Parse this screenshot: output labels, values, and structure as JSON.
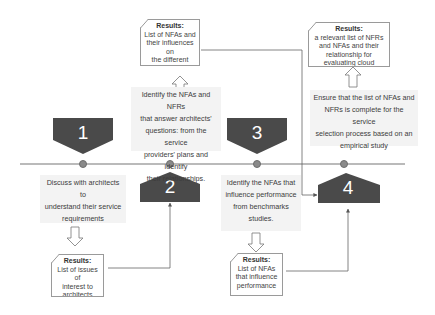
{
  "diagram": {
    "type": "process-timeline",
    "colors": {
      "badge": "#4a4a4a",
      "timeline": "#777777",
      "dot": "#8a8a8a",
      "desc_bg": "#f3f3f3",
      "result_border": "#9a9a9a"
    },
    "steps": [
      {
        "number": "1",
        "description": "Discuss with architects to understand their service requirements",
        "desc_lines": [
          "Discuss with architects to",
          "understand their service",
          "requirements"
        ],
        "result_title": "Results:",
        "result_lines": [
          "List of issues of",
          "interest to",
          "architects"
        ]
      },
      {
        "number": "2",
        "description": "Identify the NFAs and NFRs that answer architects' questions: from the service providers' plans and identify their relationships.",
        "desc_lines": [
          "Identify the NFAs and NFRs",
          "that answer architects'",
          "questions: from the service",
          "providers' plans and identify",
          "their relationships."
        ],
        "result_title": "Results:",
        "result_lines": [
          "List of NFAs and",
          "their influences on",
          "the different",
          "NFRs."
        ]
      },
      {
        "number": "3",
        "description": "Identify the NFAs that influence performance from benchmarks studies.",
        "desc_lines": [
          "Identify the NFAs that",
          "influence performance",
          "from benchmarks",
          "studies."
        ],
        "result_title": "Results:",
        "result_lines": [
          "List of NFAs",
          "that influence",
          "performance"
        ]
      },
      {
        "number": "4",
        "description": "Ensure that the list of NFAs and NFRs is complete for the service selection process based on an empirical study",
        "desc_lines": [
          "Ensure that the list of NFAs and",
          "NFRs is complete for the service",
          "selection process based on an",
          "empirical study"
        ],
        "result_title": "Results:",
        "result_lines": [
          "a relevant list of NFRs",
          "and NFAs and their",
          "relationship for",
          "evaluating cloud services"
        ]
      }
    ]
  }
}
